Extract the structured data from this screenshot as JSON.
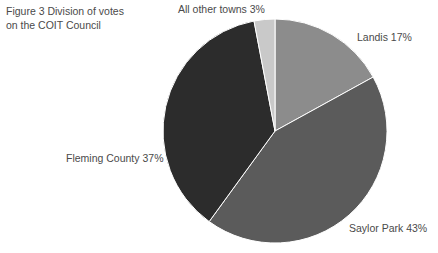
{
  "figure": {
    "caption_number": "Figure 3",
    "caption_text": "Division of votes on the COIT Council",
    "caption_full": "Figure 3   Division of votes\non the COIT Council"
  },
  "labels": {
    "all_other_towns": "All other towns 3%",
    "landis": "Landis 17%",
    "saylor_park": "Saylor Park 43%",
    "fleming_county": "Fleming County 37%"
  },
  "chart_data": {
    "type": "pie",
    "title": "Figure 3   Division of votes on the COIT Council",
    "categories": [
      "Landis",
      "Saylor Park",
      "Fleming County",
      "All other towns"
    ],
    "values": [
      17,
      43,
      37,
      3
    ],
    "value_unit": "%",
    "labels": [
      "Landis 17%",
      "Saylor Park 43%",
      "Fleming County 37%",
      "All other towns 3%"
    ],
    "colors": [
      "#8c8c8c",
      "#5b5b5b",
      "#2c2c2c",
      "#c9c9c9"
    ],
    "start_angle_deg": 0,
    "direction": "clockwise",
    "legend": "none",
    "grid": false,
    "center": [
      113,
      113
    ],
    "radius": 112
  }
}
